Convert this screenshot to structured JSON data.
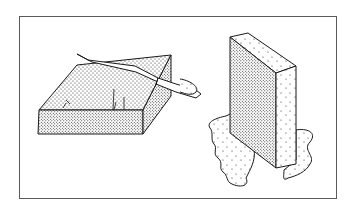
{
  "illustration": {
    "description": "Line drawing of two stippled foam blocks: a flat block being cut with a knife, and an upright block standing in a puddle",
    "colors": {
      "ink": "#1a1a1a",
      "frame": "#5a5a5a",
      "background": "#ffffff"
    },
    "objects": [
      {
        "name": "flat-foam-block",
        "label": ""
      },
      {
        "name": "knife",
        "label": ""
      },
      {
        "name": "upright-foam-block",
        "label": ""
      },
      {
        "name": "puddle",
        "label": ""
      }
    ]
  }
}
